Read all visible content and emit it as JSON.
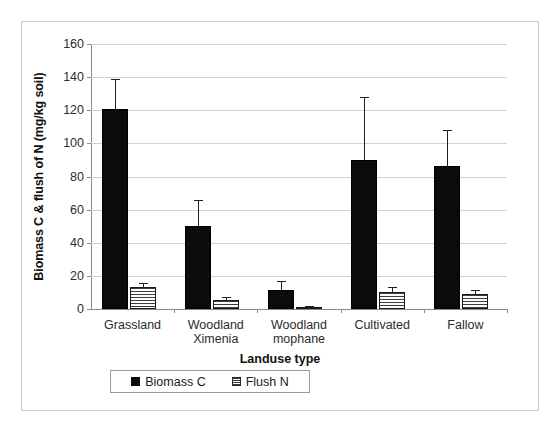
{
  "chart_data": {
    "type": "bar",
    "title": "",
    "xlabel": "Landuse type",
    "ylabel": "Biomass C & flush of N (mg/kg soil)",
    "ylim": [
      0,
      160
    ],
    "yticks": [
      0,
      20,
      40,
      60,
      80,
      100,
      120,
      140,
      160
    ],
    "grid": true,
    "legend_position": "bottom",
    "categories": [
      "Grassland",
      "Woodland Ximenia",
      "Woodland mophane",
      "Cultivated",
      "Fallow"
    ],
    "series": [
      {
        "name": "Biomass C",
        "color": "#0b0b0b",
        "pattern": "solid",
        "values": [
          120.5,
          50.0,
          11.5,
          90.0,
          86.5
        ],
        "errors_upper": [
          139.0,
          66.0,
          17.0,
          128.0,
          108.0
        ]
      },
      {
        "name": "Flush N",
        "color": "#f2f2f2",
        "pattern": "horizontal-stripes",
        "values": [
          13.5,
          5.5,
          1.2,
          10.0,
          9.0
        ],
        "errors_upper": [
          16.0,
          7.0,
          1.8,
          13.5,
          11.5
        ]
      }
    ]
  },
  "axis": {
    "ytick_labels": [
      "160",
      "140",
      "120",
      "100",
      "80",
      "60",
      "40",
      "20",
      "0"
    ],
    "y_title": "Biomass C & flush of N (mg/kg soil)",
    "x_title": "Landuse type",
    "xtick_labels": [
      "Grassland",
      "Woodland\nXimenia",
      "Woodland\nmophane",
      "Cultivated",
      "Fallow"
    ]
  },
  "legend": {
    "entries": [
      {
        "label": "Biomass C",
        "swatch": "black-square-icon"
      },
      {
        "label": "Flush N",
        "swatch": "striped-square-icon"
      }
    ]
  },
  "colors": {
    "biomass": "#0b0b0b",
    "flush_fill": "#f2f2f2",
    "flush_stripe": "#3c3c3c",
    "gridline": "#d2d2d2",
    "axis": "#8a8a8a",
    "frame": "#c9c9c9"
  }
}
